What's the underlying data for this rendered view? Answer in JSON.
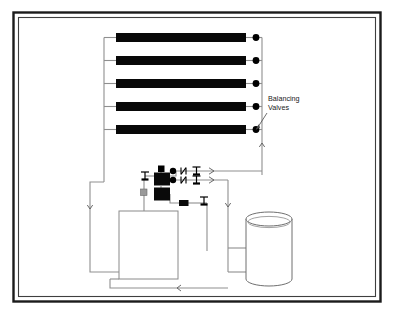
{
  "diagram": {
    "frame": {
      "outer_color": "#1b1b1b",
      "inner_color": "#3a3a3a",
      "background": "#ffffff"
    },
    "line_color": "#8a8a8a",
    "symbol_color": "#000000",
    "annotations": [
      {
        "name": "balancing-valves",
        "line1": "Balancing",
        "line2": "Valves",
        "x": 268,
        "y": 99
      }
    ],
    "collectors": {
      "count": 5,
      "label": "solar collector panel",
      "fill": "#080808",
      "x": 116,
      "width": 130,
      "height": 9,
      "ys": [
        33,
        56,
        79,
        102,
        125
      ]
    },
    "balancing_valves": {
      "count": 5,
      "label": "balancing valve",
      "x": 256,
      "radius": 3.4,
      "ys": [
        37.5,
        60.5,
        83.5,
        106.5,
        129.5
      ]
    },
    "components": [
      {
        "name": "storage-tank",
        "label": "storage tank",
        "shape": "cylinder",
        "x": 246,
        "y": 214,
        "width": 46,
        "height": 72
      },
      {
        "name": "pool-heat-exchanger",
        "label": "pool / heat exchanger",
        "shape": "rectangle",
        "x": 119,
        "y": 211,
        "width": 59,
        "height": 68
      },
      {
        "name": "pump-module",
        "label": "pump module",
        "shape": "filled-rect",
        "x": 155,
        "y": 173,
        "width": 15,
        "height": 13
      },
      {
        "name": "controller-module",
        "label": "controller module",
        "shape": "filled-rect",
        "x": 155,
        "y": 188,
        "width": 15,
        "height": 13
      },
      {
        "name": "expansion-cap",
        "label": "expansion cap",
        "shape": "filled-rect",
        "x": 158,
        "y": 166,
        "width": 6,
        "height": 6
      },
      {
        "name": "inline-pump",
        "label": "inline pump",
        "shape": "filled-rect",
        "x": 179,
        "y": 200,
        "width": 9,
        "height": 6
      },
      {
        "name": "gauge",
        "label": "pressure gauge",
        "shape": "gray-square",
        "x": 141,
        "y": 189,
        "width": 6,
        "height": 6
      }
    ],
    "flow_arrows": [
      {
        "name": "supply-arrow-upper",
        "direction": "right",
        "x": 212,
        "y": 171
      },
      {
        "name": "supply-arrow-lower",
        "direction": "right",
        "x": 212,
        "y": 180
      },
      {
        "name": "riser-arrow",
        "direction": "up",
        "x": 262,
        "y": 144
      },
      {
        "name": "return-arrow-left",
        "direction": "down",
        "x": 90,
        "y": 208
      },
      {
        "name": "tank-arrow-down",
        "direction": "down",
        "x": 228,
        "y": 206
      },
      {
        "name": "return-arrow-bottom",
        "direction": "left",
        "x": 177,
        "y": 283
      }
    ],
    "valve_symbols": [
      {
        "name": "check-valve",
        "x": 183,
        "y": 171
      },
      {
        "name": "gate-valve",
        "x": 196,
        "y": 171
      },
      {
        "name": "check-valve",
        "x": 183,
        "y": 180
      },
      {
        "name": "gate-valve",
        "x": 196,
        "y": 180
      },
      {
        "name": "gate-valve",
        "x": 145,
        "y": 176
      },
      {
        "name": "gate-valve",
        "x": 204,
        "y": 201
      }
    ]
  }
}
